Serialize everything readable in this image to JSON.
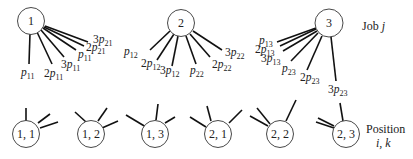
{
  "diagram": {
    "type": "bipartite-assignment",
    "legend": {
      "jobs_label_prefix": "Job ",
      "jobs_label_var": "j",
      "positions_label": "Position",
      "positions_label_vars": "i, k"
    },
    "jobs": [
      {
        "id": "1",
        "label": "1",
        "edges": [
          {
            "coef": "",
            "sub": "11"
          },
          {
            "coef": "2",
            "sub": "11"
          },
          {
            "coef": "3",
            "sub": "11"
          },
          {
            "coef": "",
            "sub": "11"
          },
          {
            "coef": "2",
            "sub": "21"
          },
          {
            "coef": "3",
            "sub": "21"
          }
        ]
      },
      {
        "id": "2",
        "label": "2",
        "edges": [
          {
            "coef": "",
            "sub": "12"
          },
          {
            "coef": "2",
            "sub": "12"
          },
          {
            "coef": "3",
            "sub": "12"
          },
          {
            "coef": "",
            "sub": "22"
          },
          {
            "coef": "2",
            "sub": "22"
          },
          {
            "coef": "3",
            "sub": "22"
          }
        ]
      },
      {
        "id": "3",
        "label": "3",
        "edges": [
          {
            "coef": "",
            "sub": "13"
          },
          {
            "coef": "2",
            "sub": "13"
          },
          {
            "coef": "3",
            "sub": "13"
          },
          {
            "coef": "",
            "sub": "23"
          },
          {
            "coef": "2",
            "sub": "23"
          },
          {
            "coef": "3",
            "sub": "23"
          }
        ]
      }
    ],
    "positions": [
      {
        "id": "1,1",
        "label": "1, 1"
      },
      {
        "id": "1,2",
        "label": "1, 2"
      },
      {
        "id": "1,3",
        "label": "1, 3"
      },
      {
        "id": "2,1",
        "label": "2, 1"
      },
      {
        "id": "2,2",
        "label": "2, 2"
      },
      {
        "id": "2,3",
        "label": "2, 3"
      }
    ],
    "edge_symbol": "p"
  }
}
